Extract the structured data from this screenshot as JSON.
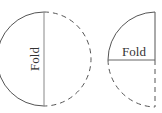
{
  "diagram": {
    "left_figure": {
      "description": "Circle folded in half along vertical diameter",
      "fold_label": "Fold"
    },
    "right_figure": {
      "description": "Half-circle folded again along horizontal radius into a quarter",
      "fold_label": "Fold"
    },
    "colors": {
      "solid_stroke": "#555555",
      "dashed_stroke": "#555555",
      "fold_line": "#888888",
      "text": "#333333"
    }
  }
}
